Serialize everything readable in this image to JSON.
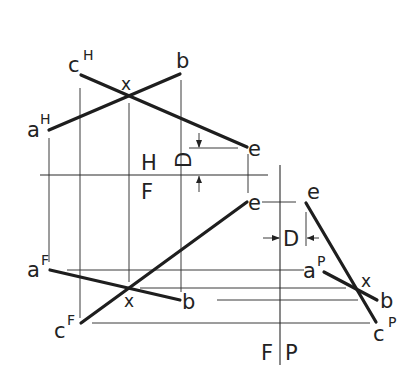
{
  "diagram": {
    "fold_lines": {
      "hf": {
        "upper_label": "H",
        "lower_label": "F"
      },
      "fp": {
        "left_label": "F",
        "right_label": "P"
      }
    },
    "top_view": {
      "labels": {
        "a": "a",
        "a_sup": "H",
        "c": "c",
        "c_sup": "H",
        "b": "b",
        "x": "x",
        "e": "e",
        "d": "D"
      }
    },
    "front_view": {
      "labels": {
        "a": "a",
        "a_sup": "F",
        "c": "c",
        "c_sup": "F",
        "b": "b",
        "x": "x",
        "e": "e"
      }
    },
    "profile_view": {
      "labels": {
        "a": "a",
        "a_sup": "P",
        "c": "c",
        "c_sup": "P",
        "b": "b",
        "x": "x",
        "e": "e",
        "d": "D"
      }
    },
    "colors": {
      "ink": "#1e1e1e",
      "background": "#ffffff"
    }
  }
}
